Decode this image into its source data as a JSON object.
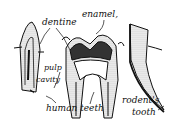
{
  "diagram": {
    "labels": {
      "dentine": "dentine",
      "enamel": "enamel,",
      "pulp_line1": "pulp",
      "pulp_line2": "cavity",
      "human": "human teeth",
      "rodent_line1": "rodent's",
      "rodent_line2": "tooth"
    },
    "colors": {
      "ink": "#111111",
      "background": "#ffffff",
      "stipple": "#9a9a9a"
    }
  }
}
